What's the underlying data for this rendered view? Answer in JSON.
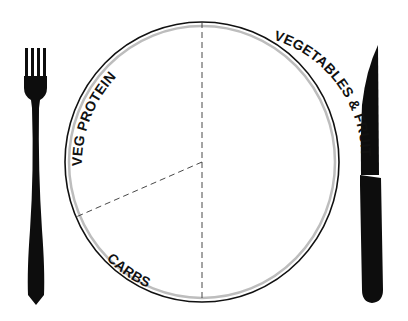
{
  "sections": [
    {
      "label": "VEG PROTEIN",
      "portion": 0.25
    },
    {
      "label": "VEGETABLES & FRUIT",
      "portion": 0.5
    },
    {
      "label": "CARBS",
      "portion": 0.25
    }
  ],
  "utensils": {
    "left": "fork",
    "right": "knife"
  },
  "colors": {
    "plate_outline": "#111111",
    "plate_rim": "#bdbdbd",
    "utensil": "#0d0d0d",
    "divider": "#333333"
  }
}
